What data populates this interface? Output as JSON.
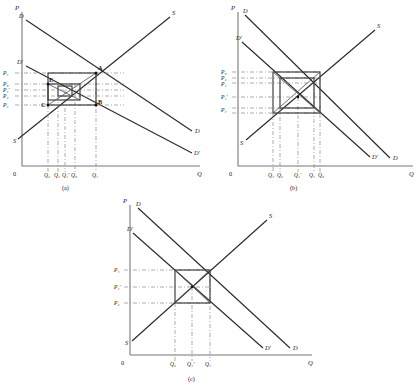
{
  "figure": {
    "title": "",
    "panels": [
      {
        "id": "a",
        "caption": "(a)",
        "axes": {
          "y_name": "P",
          "x_name": "Q",
          "origin": "0"
        },
        "curve_labels": {
          "demand_start": "D",
          "demand_shift_start": "D'",
          "demand_end": "D",
          "demand_shift_end": "D'",
          "supply_start": "S",
          "supply_end": "S"
        },
        "y_ticks": [
          "P₁",
          "P₃",
          "P₁'",
          "P₂",
          "P₄"
        ],
        "x_ticks": [
          "Q₂",
          "Q₄",
          "Q₁'",
          "Q₃",
          "Q₁"
        ],
        "points": [
          "A",
          "B",
          "C",
          "E"
        ]
      },
      {
        "id": "b",
        "caption": "(b)",
        "axes": {
          "y_name": "P",
          "x_name": "Q",
          "origin": "0"
        },
        "curve_labels": {
          "demand_start": "D",
          "demand_shift_start": "D'",
          "demand_end": "D",
          "demand_shift_end": "D'",
          "supply_start": "S",
          "supply_end": "S"
        },
        "y_ticks": [
          "P₃",
          "P₂",
          "P₁",
          "P₁'",
          "P₄"
        ],
        "x_ticks": [
          "Q₄",
          "Q₂",
          "Q₁'",
          "Q₁",
          "Q₃"
        ],
        "points": []
      },
      {
        "id": "c",
        "caption": "(c)",
        "axes": {
          "y_name": "P",
          "x_name": "Q",
          "origin": "0"
        },
        "curve_labels": {
          "demand_start": "D",
          "demand_shift_start": "D'",
          "demand_end": "D",
          "demand_shift_end": "D'",
          "supply_start": "S",
          "supply_end": "S"
        },
        "y_ticks": [
          "P₁",
          "P₁'",
          "P₂"
        ],
        "x_ticks": [
          "Q₂",
          "Q₁'",
          "Q₁"
        ],
        "points": []
      }
    ]
  },
  "colors": {
    "axis": "#777777",
    "curve": "#2b2b2b",
    "cobweb": "#3a3a3a",
    "guide": "#8a8a8a",
    "background": "#ffffff"
  }
}
